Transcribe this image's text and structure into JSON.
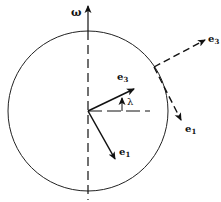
{
  "diagram": {
    "type": "rotating-earth-frame",
    "labels": {
      "omega": "ω",
      "e3_inner": "e",
      "e3_inner_sub": "3",
      "e1_inner": "e",
      "e1_inner_sub": "1",
      "e3_outer": "e",
      "e3_outer_sub": "3",
      "e1_outer": "e",
      "e1_outer_sub": "1",
      "lambda": "λ"
    },
    "geometry": {
      "center": [
        88,
        111
      ],
      "radius": 80,
      "surface_point": [
        154,
        67
      ]
    },
    "colors": {
      "stroke": "#111111",
      "background": "#ffffff"
    }
  }
}
